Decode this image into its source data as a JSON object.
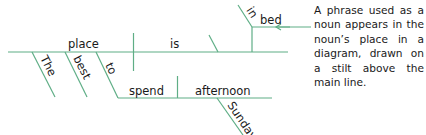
{
  "diagram": {
    "type": "sentence-diagram",
    "line_color": "#5fae86",
    "words": {
      "subject": "place",
      "verb": "is",
      "article": "The",
      "adjective": "best",
      "infinitive_marker": "to",
      "infinitive_verb": "spend",
      "infinitive_object": "afternoon",
      "object_modifier": "Sunday",
      "preposition": "in",
      "prepositional_object": "bed"
    },
    "annotation": "A phrase used as a noun appears in the noun’s place in a diagram, drawn on a stilt above the main line."
  }
}
